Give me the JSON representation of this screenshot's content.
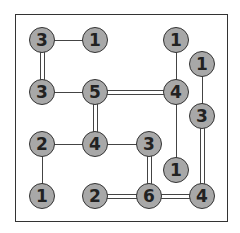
{
  "puzzle": {
    "type": "hashi",
    "colors": {
      "island_fill": "#a8a8a8",
      "island_border": "#333333",
      "line": "#444444",
      "background": "#ffffff"
    },
    "islands": [
      {
        "id": "a",
        "value": "3",
        "x": 42,
        "y": 40
      },
      {
        "id": "b",
        "value": "1",
        "x": 95,
        "y": 40
      },
      {
        "id": "c",
        "value": "1",
        "x": 176,
        "y": 40
      },
      {
        "id": "d",
        "value": "1",
        "x": 202,
        "y": 64
      },
      {
        "id": "e",
        "value": "3",
        "x": 42,
        "y": 92
      },
      {
        "id": "f",
        "value": "5",
        "x": 95,
        "y": 92
      },
      {
        "id": "g",
        "value": "4",
        "x": 176,
        "y": 92
      },
      {
        "id": "h",
        "value": "3",
        "x": 202,
        "y": 116
      },
      {
        "id": "i",
        "value": "2",
        "x": 42,
        "y": 144
      },
      {
        "id": "j",
        "value": "4",
        "x": 95,
        "y": 144
      },
      {
        "id": "k",
        "value": "3",
        "x": 149,
        "y": 144
      },
      {
        "id": "l",
        "value": "1",
        "x": 176,
        "y": 170
      },
      {
        "id": "m",
        "value": "1",
        "x": 42,
        "y": 196
      },
      {
        "id": "n",
        "value": "2",
        "x": 95,
        "y": 196
      },
      {
        "id": "o",
        "value": "6",
        "x": 149,
        "y": 196
      },
      {
        "id": "p",
        "value": "4",
        "x": 202,
        "y": 196
      }
    ],
    "bridges": [
      {
        "from": "a",
        "to": "b",
        "count": 1
      },
      {
        "from": "a",
        "to": "e",
        "count": 2
      },
      {
        "from": "e",
        "to": "f",
        "count": 1
      },
      {
        "from": "f",
        "to": "g",
        "count": 2
      },
      {
        "from": "f",
        "to": "j",
        "count": 2
      },
      {
        "from": "c",
        "to": "g",
        "count": 1
      },
      {
        "from": "g",
        "to": "l",
        "count": 1
      },
      {
        "from": "d",
        "to": "h",
        "count": 1
      },
      {
        "from": "h",
        "to": "p",
        "count": 2
      },
      {
        "from": "i",
        "to": "j",
        "count": 1
      },
      {
        "from": "i",
        "to": "m",
        "count": 1
      },
      {
        "from": "j",
        "to": "k",
        "count": 1
      },
      {
        "from": "k",
        "to": "o",
        "count": 2
      },
      {
        "from": "n",
        "to": "o",
        "count": 2
      },
      {
        "from": "o",
        "to": "p",
        "count": 2
      }
    ]
  }
}
